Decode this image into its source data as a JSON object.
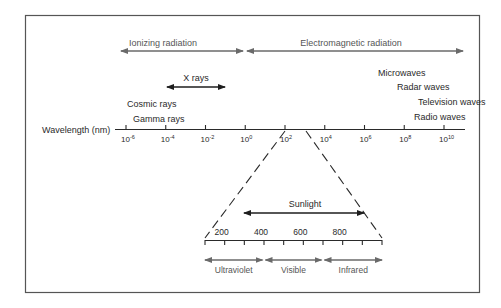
{
  "diagram": {
    "ranges_top": [
      {
        "label": "Ionizing radiation",
        "from_exp": -6.5,
        "to_exp": 0
      },
      {
        "label": "Electromagnetic radiation",
        "from_exp": 0,
        "to_exp": 11
      }
    ],
    "xrays": {
      "label": "X rays",
      "from_exp": -4.1,
      "to_exp": -1.1
    },
    "labels_left": [
      "Cosmic rays",
      "Gamma rays"
    ],
    "labels_right": [
      "Microwaves",
      "Radar waves",
      "Television waves",
      "Radio waves"
    ],
    "axis": {
      "label": "Wavelength (nm)",
      "ticks": [
        {
          "base": "10",
          "exp": "-6"
        },
        {
          "base": "10",
          "exp": "-4"
        },
        {
          "base": "10",
          "exp": "-2"
        },
        {
          "base": "10",
          "exp": "0"
        },
        {
          "base": "10",
          "exp": "2"
        },
        {
          "base": "10",
          "exp": "4"
        },
        {
          "base": "10",
          "exp": "6"
        },
        {
          "base": "10",
          "exp": "8"
        },
        {
          "base": "10",
          "exp": "10"
        }
      ]
    },
    "zoom_axis": {
      "range_nm": [
        100,
        1000
      ],
      "tick_labels": [
        "200",
        "400",
        "600",
        "800"
      ],
      "sunlight": {
        "label": "Sunlight",
        "from_nm": 300,
        "to_nm": 950
      }
    },
    "bands": [
      {
        "label": "Ultraviolet",
        "from_nm": 100,
        "to_nm": 400
      },
      {
        "label": "Visible",
        "from_nm": 400,
        "to_nm": 700
      },
      {
        "label": "Infrared",
        "from_nm": 700,
        "to_nm": 1000
      }
    ],
    "colors": {
      "dark": "#1e1e1e",
      "gray": "#6a6a6a",
      "frame": "#555555"
    }
  }
}
